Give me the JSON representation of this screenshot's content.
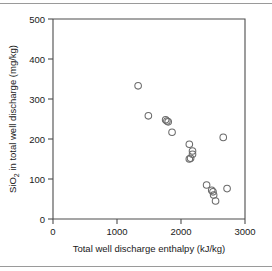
{
  "chart_data": {
    "type": "scatter",
    "title": "",
    "xlabel": "Total well discharge enthalpy (kJ/kg)",
    "ylabel_main": "SiO",
    "ylabel_sub": "2",
    "ylabel_rest": " in total well discharge (mg/kg)",
    "ylabel_full": "SiO2 in total well discharge (mg/kg)",
    "xlim": [
      0,
      3000
    ],
    "ylim": [
      0,
      500
    ],
    "xticks": [
      0,
      1000,
      2000,
      3000
    ],
    "yticks": [
      0,
      100,
      200,
      300,
      400,
      500
    ],
    "xtick_labels": [
      "0",
      "1000",
      "2000",
      "3000"
    ],
    "ytick_labels": [
      "0",
      "100",
      "200",
      "300",
      "400",
      "500"
    ],
    "grid": false,
    "legend": false,
    "marker": "open-circle",
    "marker_color": "#6b6b6b",
    "series": [
      {
        "name": "well samples",
        "points": [
          [
            1330,
            333
          ],
          [
            1490,
            258
          ],
          [
            1760,
            248
          ],
          [
            1780,
            245
          ],
          [
            1800,
            243
          ],
          [
            1860,
            217
          ],
          [
            2130,
            187
          ],
          [
            2180,
            170
          ],
          [
            2180,
            162
          ],
          [
            2150,
            152
          ],
          [
            2130,
            150
          ],
          [
            2660,
            204
          ],
          [
            2400,
            85
          ],
          [
            2480,
            72
          ],
          [
            2500,
            68
          ],
          [
            2510,
            60
          ],
          [
            2540,
            45
          ],
          [
            2720,
            76
          ]
        ]
      }
    ]
  },
  "axes": {
    "x_tick_0": "0",
    "x_tick_1": "1000",
    "x_tick_2": "2000",
    "x_tick_3": "3000",
    "y_tick_0": "0",
    "y_tick_1": "100",
    "y_tick_2": "200",
    "y_tick_3": "300",
    "y_tick_4": "400",
    "y_tick_5": "500"
  },
  "labels": {
    "x_axis_title": "Total well discharge enthalpy (kJ/kg)",
    "y_axis_title_part1": "SiO",
    "y_axis_title_sub": "2",
    "y_axis_title_part2": " in total well discharge (mg/kg)"
  }
}
